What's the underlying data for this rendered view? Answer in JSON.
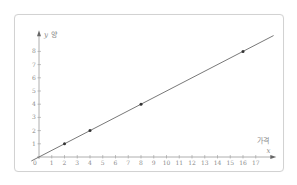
{
  "chart_data": {
    "type": "line",
    "title": "",
    "xlabel": "가격",
    "xvar": "x",
    "ylabel": "양",
    "yvar": "y",
    "x_ticks": [
      1,
      2,
      3,
      4,
      5,
      6,
      7,
      8,
      9,
      10,
      11,
      12,
      13,
      14,
      15,
      16,
      17
    ],
    "y_ticks": [
      1,
      2,
      3,
      4,
      5,
      6,
      7,
      8
    ],
    "xlim": [
      0,
      18
    ],
    "ylim": [
      0,
      9
    ],
    "grid": false,
    "series": [
      {
        "name": "y = x/2",
        "line": {
          "slope": 0.5,
          "intercept": 0
        },
        "points": [
          {
            "x": 2,
            "y": 1
          },
          {
            "x": 4,
            "y": 2
          },
          {
            "x": 8,
            "y": 4
          },
          {
            "x": 16,
            "y": 8
          }
        ]
      }
    ]
  },
  "colors": {
    "axis": "#9a9a9a",
    "line": "#555555",
    "point": "#333333",
    "border": "#d2d2d2"
  }
}
